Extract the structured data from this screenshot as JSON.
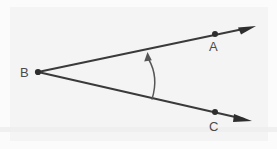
{
  "figure": {
    "background_color": "#f4f4f4",
    "stroke_color": "#3a3a3a",
    "label_color": "#4a4a4a",
    "arc_color": "#565656",
    "points": [
      {
        "id": "B",
        "label": "B",
        "role": "vertex",
        "x": 38,
        "y": 72,
        "label_x": 20,
        "label_y": 77,
        "has_dot": true
      },
      {
        "id": "A",
        "label": "A",
        "role": "ray-point",
        "x": 215,
        "y": 34,
        "label_x": 209,
        "label_y": 51,
        "has_dot": true
      },
      {
        "id": "C",
        "label": "C",
        "role": "ray-point",
        "x": 215,
        "y": 112,
        "label_x": 209,
        "label_y": 131,
        "has_dot": true
      }
    ],
    "rays": [
      {
        "id": "BA",
        "from": "B",
        "through": "A",
        "tip_x": 256,
        "tip_y": 26,
        "arrow": true
      },
      {
        "id": "BC",
        "from": "B",
        "through": "C",
        "tip_x": 252,
        "tip_y": 121,
        "arrow": true
      }
    ],
    "angle_arc": {
      "id": "angle-ABC",
      "from_x": 152,
      "from_y": 99,
      "to_x": 148,
      "to_y": 54,
      "control_x": 160,
      "control_y": 77,
      "arrow_direction": "up"
    }
  }
}
